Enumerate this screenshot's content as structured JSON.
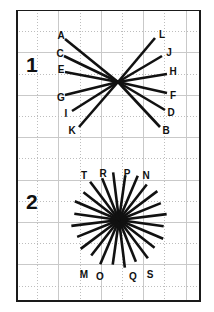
{
  "page": {
    "width": 214,
    "height": 312,
    "background": "#ffffff",
    "ink_color": "#111111",
    "grid_color": "#c9c9c9",
    "border_color": "#1a1a1a"
  },
  "frame": {
    "x": 16,
    "y": 10,
    "width": 185,
    "height": 292,
    "grid_spacing": 21.2,
    "grid_cols": 9,
    "grid_rows": 14
  },
  "figures": [
    {
      "id": "figure-1",
      "number_label": "1",
      "number_x": 26,
      "number_y": 54,
      "type": "bow-tie-convergence",
      "center": {
        "x": 118,
        "y": 82
      },
      "ray_count": 12,
      "rays": [
        {
          "label": "A",
          "end_x": 65,
          "end_y": 39,
          "label_x": 61,
          "label_y": 36
        },
        {
          "label": "C",
          "end_x": 64,
          "end_y": 56,
          "label_x": 60,
          "label_y": 54
        },
        {
          "label": "E",
          "end_x": 65,
          "end_y": 72,
          "label_x": 61,
          "label_y": 70
        },
        {
          "label": "G",
          "end_x": 65,
          "end_y": 95,
          "label_x": 61,
          "label_y": 98
        },
        {
          "label": "I",
          "end_x": 72,
          "end_y": 111,
          "label_x": 66,
          "label_y": 114
        },
        {
          "label": "K",
          "end_x": 79,
          "end_y": 127,
          "label_x": 72,
          "label_y": 131
        },
        {
          "label": "B",
          "end_x": 160,
          "end_y": 127,
          "label_x": 166,
          "label_y": 131
        },
        {
          "label": "D",
          "end_x": 165,
          "end_y": 110,
          "label_x": 171,
          "label_y": 113
        },
        {
          "label": "F",
          "end_x": 167,
          "end_y": 93,
          "label_x": 173,
          "label_y": 96
        },
        {
          "label": "H",
          "end_x": 167,
          "end_y": 74,
          "label_x": 173,
          "label_y": 72
        },
        {
          "label": "J",
          "end_x": 162,
          "end_y": 56,
          "label_x": 169,
          "label_y": 53
        },
        {
          "label": "L",
          "end_x": 155,
          "end_y": 38,
          "label_x": 162,
          "label_y": 35
        }
      ]
    },
    {
      "id": "figure-2",
      "number_label": "2",
      "number_x": 26,
      "number_y": 191,
      "type": "radial-starburst",
      "center": {
        "x": 119,
        "y": 220
      },
      "ray_count": 24,
      "radius": 48,
      "start_angle_deg": -97,
      "labeled_rays": [
        {
          "label": "T",
          "label_x": 84,
          "label_y": 176
        },
        {
          "label": "R",
          "label_x": 103,
          "label_y": 174
        },
        {
          "label": "P",
          "label_x": 127,
          "label_y": 174
        },
        {
          "label": "N",
          "label_x": 146,
          "label_y": 176
        },
        {
          "label": "M",
          "label_x": 84,
          "label_y": 275
        },
        {
          "label": "O",
          "label_x": 100,
          "label_y": 277
        },
        {
          "label": "Q",
          "label_x": 133,
          "label_y": 277
        },
        {
          "label": "S",
          "label_x": 150,
          "label_y": 275
        }
      ]
    }
  ],
  "chart_data": {
    "type": "scatter",
    "title": "",
    "xlabel": "",
    "ylabel": "",
    "series": [
      {
        "name": "Figure 1 rays",
        "labels": [
          "A",
          "C",
          "E",
          "G",
          "I",
          "K",
          "B",
          "D",
          "F",
          "H",
          "J",
          "L"
        ],
        "values": [
          12
        ]
      },
      {
        "name": "Figure 2 rays",
        "labels": [
          "T",
          "R",
          "P",
          "N",
          "M",
          "O",
          "Q",
          "S"
        ],
        "values": [
          24
        ]
      }
    ]
  }
}
